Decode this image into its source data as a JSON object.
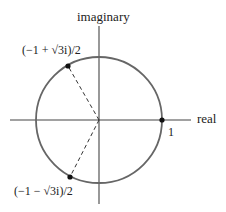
{
  "diagram": {
    "axes": {
      "horizontal_label": "real",
      "vertical_label": "imaginary"
    },
    "circle": {
      "label": "unit circle",
      "stroke": "#666666"
    },
    "points": [
      {
        "id": "one",
        "label": "1",
        "angle_deg": 0
      },
      {
        "id": "upper",
        "label": "(−1 + √3i)/2",
        "angle_deg": 120
      },
      {
        "id": "lower",
        "label": "(−1 − √3i)/2",
        "angle_deg": 240
      }
    ],
    "dashed_rays": [
      "upper",
      "lower"
    ]
  }
}
